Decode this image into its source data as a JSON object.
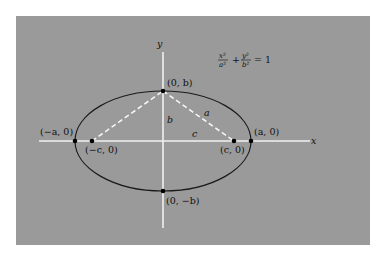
{
  "diagram": {
    "equation": {
      "x_num": "x²",
      "x_den": "a²",
      "plus": "+",
      "y_num": "y²",
      "y_den": "b²",
      "rhs": "= 1"
    },
    "axes": {
      "x_label": "x",
      "y_label": "y"
    },
    "points": {
      "top_vertex": "(0, b)",
      "bottom_vertex": "(0, −b)",
      "left_vertex": "(−a, 0)",
      "right_vertex": "(a, 0)",
      "left_focus": "(−c, 0)",
      "right_focus": "(c, 0)"
    },
    "segments": {
      "a_label": "a",
      "b_label": "b",
      "c_label": "c"
    },
    "colors": {
      "background": "#9a9a9a",
      "page": "#ffffff",
      "ellipse": "#1a1a1a",
      "axes": "#f0f0f0",
      "dashed": "#f5f5f5",
      "points": "#000000"
    }
  }
}
